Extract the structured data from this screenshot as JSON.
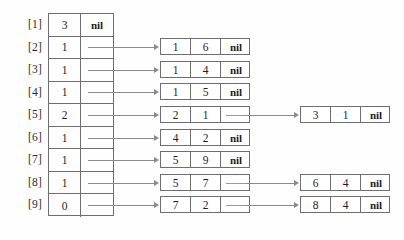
{
  "diagram": {
    "type": "hash-table-with-chaining",
    "title": "",
    "table": {
      "name": "hash-table",
      "slot_labels": [
        "[1]",
        "[2]",
        "[3]",
        "[4]",
        "[5]",
        "[6]",
        "[7]",
        "[8]",
        "[9]"
      ],
      "rows": [
        {
          "label": "[1]",
          "count": "3",
          "pointer": "nil",
          "has_pointer": false
        },
        {
          "label": "[2]",
          "count": "1",
          "pointer": "",
          "has_pointer": true
        },
        {
          "label": "[3]",
          "count": "1",
          "pointer": "",
          "has_pointer": true
        },
        {
          "label": "[4]",
          "count": "1",
          "pointer": "",
          "has_pointer": true
        },
        {
          "label": "[5]",
          "count": "2",
          "pointer": "",
          "has_pointer": true
        },
        {
          "label": "[6]",
          "count": "1",
          "pointer": "",
          "has_pointer": true
        },
        {
          "label": "[7]",
          "count": "1",
          "pointer": "",
          "has_pointer": true
        },
        {
          "label": "[8]",
          "count": "1",
          "pointer": "",
          "has_pointer": true
        },
        {
          "label": "[9]",
          "count": "0",
          "pointer": "",
          "has_pointer": true
        }
      ]
    },
    "chains": [
      {
        "slot": "[2]",
        "nodes": [
          {
            "key": "1",
            "value": "6",
            "next": "nil",
            "next_is_nil": true
          }
        ]
      },
      {
        "slot": "[3]",
        "nodes": [
          {
            "key": "1",
            "value": "4",
            "next": "nil",
            "next_is_nil": true
          }
        ]
      },
      {
        "slot": "[4]",
        "nodes": [
          {
            "key": "1",
            "value": "5",
            "next": "nil",
            "next_is_nil": true
          }
        ]
      },
      {
        "slot": "[5]",
        "nodes": [
          {
            "key": "2",
            "value": "1",
            "next": "",
            "next_is_nil": false
          },
          {
            "key": "3",
            "value": "1",
            "next": "nil",
            "next_is_nil": true
          }
        ]
      },
      {
        "slot": "[6]",
        "nodes": [
          {
            "key": "4",
            "value": "2",
            "next": "nil",
            "next_is_nil": true
          }
        ]
      },
      {
        "slot": "[7]",
        "nodes": [
          {
            "key": "5",
            "value": "9",
            "next": "nil",
            "next_is_nil": true
          }
        ]
      },
      {
        "slot": "[8]",
        "nodes": [
          {
            "key": "5",
            "value": "7",
            "next": "",
            "next_is_nil": false
          },
          {
            "key": "6",
            "value": "4",
            "next": "nil",
            "next_is_nil": true
          }
        ]
      },
      {
        "slot": "[9]",
        "nodes": [
          {
            "key": "7",
            "value": "2",
            "next": "",
            "next_is_nil": false
          },
          {
            "key": "8",
            "value": "4",
            "next": "nil",
            "next_is_nil": true
          }
        ]
      }
    ],
    "colors": {
      "background": "#fefefe",
      "border": "#6e6e6e",
      "connector": "#8a8a8a",
      "text": "#1d1d1d"
    }
  }
}
